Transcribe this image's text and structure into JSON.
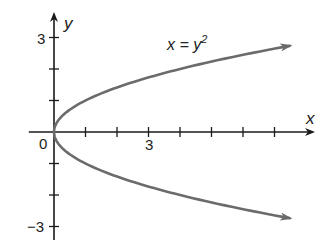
{
  "chart_data": {
    "type": "line",
    "title": "",
    "equation_label": "x = y²",
    "equation_base": "x = y",
    "equation_exp": "2",
    "xlabel": "x",
    "ylabel": "y",
    "x_tick_labels": [
      {
        "value": 0,
        "label": "0"
      },
      {
        "value": 3,
        "label": "3"
      }
    ],
    "y_tick_labels": [
      {
        "value": 3,
        "label": "3"
      },
      {
        "value": -3,
        "label": "−3"
      }
    ],
    "x_ticks": [
      1,
      2,
      3,
      4,
      5,
      6,
      7
    ],
    "y_ticks": [
      -3,
      -2,
      -1,
      1,
      2,
      3
    ],
    "xlim": [
      -0.8,
      8.6
    ],
    "ylim": [
      -3.3,
      3.5
    ],
    "grid": false,
    "series": [
      {
        "name": "x = y^2",
        "color": "#6b6b6b",
        "x": [
          7.5,
          6.25,
          4.0,
          2.25,
          1.0,
          0.25,
          0.0,
          0.25,
          1.0,
          2.25,
          4.0,
          6.25,
          7.5
        ],
        "y": [
          2.74,
          2.5,
          2.0,
          1.5,
          1.0,
          0.5,
          0.0,
          -0.5,
          -1.0,
          -1.5,
          -2.0,
          -2.5,
          -2.74
        ],
        "arrows": "both ends"
      }
    ]
  },
  "colors": {
    "axis": "#1a1a1a",
    "curve": "#6b6b6b",
    "background": "#ffffff"
  }
}
